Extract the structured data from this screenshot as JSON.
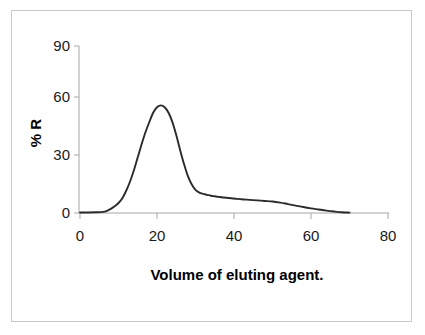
{
  "chart_data": {
    "type": "line",
    "title": "",
    "subtitle": "",
    "xlabel": "Volume of eluting agent.",
    "ylabel": "% R",
    "xlim": [
      0,
      80
    ],
    "ylim": [
      0,
      90
    ],
    "xticks": [
      0,
      20,
      40,
      60,
      80
    ],
    "yticks": [
      0,
      30,
      60,
      90
    ],
    "xtick_labels": [
      "0",
      "20",
      "40",
      "60",
      "80"
    ],
    "ytick_labels": [
      "0",
      "30",
      "60",
      "90"
    ],
    "grid": false,
    "legend": null,
    "legend_position": "none",
    "annotations": [],
    "series": [
      {
        "name": "elution profile",
        "color": "#2b2b2b",
        "x": [
          0,
          2,
          4,
          6,
          7,
          8,
          9,
          10,
          11,
          12,
          13,
          14,
          15,
          16,
          17,
          18,
          19,
          20,
          21,
          22,
          23,
          24,
          25,
          26,
          27,
          28,
          29,
          30,
          31,
          32,
          33,
          34,
          35,
          36,
          38,
          40,
          42,
          44,
          46,
          48,
          50,
          52,
          54,
          56,
          58,
          60,
          62,
          64,
          66,
          68,
          70
        ],
        "y": [
          0.3,
          0.3,
          0.4,
          0.6,
          1.2,
          2.2,
          3.6,
          5.4,
          8.0,
          12.0,
          17.0,
          23.0,
          30.0,
          37.0,
          43.5,
          49.0,
          54.0,
          57.0,
          58.0,
          57.0,
          54.0,
          49.0,
          42.0,
          34.0,
          26.5,
          20.0,
          15.5,
          12.5,
          11.0,
          10.3,
          9.8,
          9.3,
          9.0,
          8.7,
          8.2,
          7.8,
          7.4,
          7.1,
          6.8,
          6.5,
          6.2,
          5.6,
          4.8,
          4.0,
          3.2,
          2.5,
          1.9,
          1.3,
          0.8,
          0.4,
          0.2
        ]
      }
    ]
  },
  "figure": {
    "axis_color": "#a6a6a6",
    "curve_color": "#2b2b2b",
    "frame_color": "#c9c9c9",
    "background": "#ffffff"
  }
}
